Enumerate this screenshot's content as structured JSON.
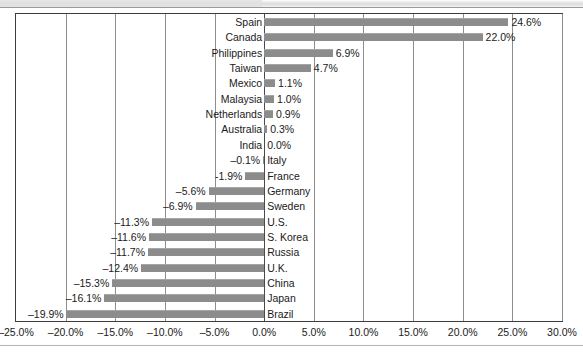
{
  "chart_data": {
    "type": "bar",
    "orientation": "horizontal",
    "title": "",
    "subtitle": "",
    "xlabel": "",
    "ylabel": "",
    "grid": true,
    "legend": "none",
    "xlim": [
      -25.0,
      30.0
    ],
    "xtick_labels": [
      "–25.0%",
      "–20.0%",
      "–15.0%",
      "–10.0%",
      "–5.0%",
      "0.0%",
      "5.0%",
      "10.0%",
      "15.0%",
      "20.0%",
      "25.0%",
      "30.0%"
    ],
    "xticks": [
      -25,
      -20,
      -15,
      -10,
      -5,
      0,
      5,
      10,
      15,
      20,
      25,
      30
    ],
    "categories": [
      "Spain",
      "Canada",
      "Philippines",
      "Taiwan",
      "Mexico",
      "Malaysia",
      "Netherlands",
      "Australia",
      "India",
      "Italy",
      "France",
      "Germany",
      "Sweden",
      "U.S.",
      "S. Korea",
      "Russia",
      "U.K.",
      "China",
      "Japan",
      "Brazil"
    ],
    "values": [
      24.6,
      22.0,
      6.9,
      4.7,
      1.1,
      1.0,
      0.9,
      0.3,
      0.0,
      -0.1,
      -1.9,
      -5.6,
      -6.9,
      -11.3,
      -11.6,
      -11.7,
      -12.4,
      -15.3,
      -16.1,
      -19.9
    ],
    "value_labels": [
      "24.6%",
      "22.0%",
      "6.9%",
      "4.7%",
      "1.1%",
      "1.0%",
      "0.9%",
      "0.3%",
      "0.0%",
      "–0.1%",
      "-1.9%",
      "–5.6%",
      "–6.9%",
      "–11.3%",
      "–11.6%",
      "–11.7%",
      "–12.4%",
      "–15.3%",
      "–16.1%",
      "–19.9%"
    ],
    "colors": {
      "bar": "#8c8c8c",
      "frame": "#3d3d3d",
      "gridline": "#8d8d8d",
      "text": "#1a1a1a",
      "background": "#ffffff"
    }
  }
}
